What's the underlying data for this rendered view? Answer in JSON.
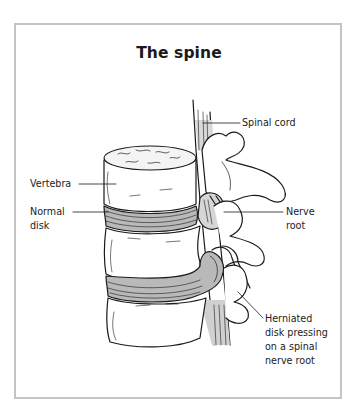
{
  "figure": {
    "title": "The spine",
    "labels": {
      "spinal_cord": "Spinal cord",
      "vertebra": "Vertebra",
      "normal_disk_line1": "Normal",
      "normal_disk_line2": "disk",
      "nerve_root_line1": "Nerve",
      "nerve_root_line2": "root",
      "herniated_line1": "Herniated",
      "herniated_line2": "disk pressing",
      "herniated_line3": "on a spinal",
      "herniated_line4": "nerve root"
    },
    "colors": {
      "frame": "#c4c4c4",
      "ink": "#1a1a1a",
      "disk_gray": "#b9b9b9"
    }
  }
}
